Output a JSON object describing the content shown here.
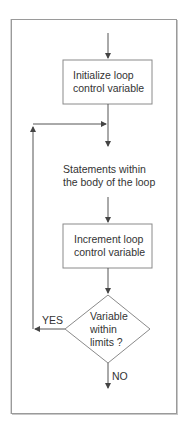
{
  "diagram": {
    "type": "flowchart",
    "title": "",
    "nodes": [
      {
        "id": "init",
        "shape": "rectangle",
        "lines": [
          "Initialize loop",
          "control variable"
        ]
      },
      {
        "id": "body",
        "shape": "text",
        "lines": [
          "Statements within",
          "the body of the loop"
        ]
      },
      {
        "id": "increment",
        "shape": "rectangle",
        "lines": [
          "Increment loop",
          "control variable"
        ]
      },
      {
        "id": "decision",
        "shape": "diamond",
        "lines": [
          "Variable",
          "within",
          "limits ?"
        ]
      }
    ],
    "edges": [
      {
        "from": "start",
        "to": "init",
        "label": ""
      },
      {
        "from": "init",
        "to": "body",
        "label": ""
      },
      {
        "from": "body",
        "to": "increment",
        "label": ""
      },
      {
        "from": "increment",
        "to": "decision",
        "label": ""
      },
      {
        "from": "decision",
        "to": "body",
        "label": "YES"
      },
      {
        "from": "decision",
        "to": "end",
        "label": "NO"
      }
    ],
    "labels": {
      "yes": "YES",
      "no": "NO"
    },
    "colors": {
      "line": "#555555",
      "border": "#9a9a9a",
      "text": "#333333",
      "background": "#ffffff"
    }
  }
}
